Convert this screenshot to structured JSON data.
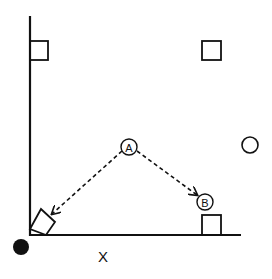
{
  "diagram": {
    "colors": {
      "ink": "#111111",
      "background": "#ffffff"
    },
    "axes": {
      "x_label": "X"
    },
    "nodes": {
      "a": {
        "label": "A",
        "shape": "circle-labeled"
      },
      "b": {
        "label": "B",
        "shape": "circle-labeled"
      }
    },
    "shapes": [
      {
        "id": "square-top-left",
        "shape": "square"
      },
      {
        "id": "square-top-right",
        "shape": "square"
      },
      {
        "id": "square-bottom-right",
        "shape": "square"
      },
      {
        "id": "square-rotated-origin",
        "shape": "rotated-square"
      },
      {
        "id": "circle-right",
        "shape": "circle-open"
      },
      {
        "id": "dot-origin",
        "shape": "circle-filled"
      }
    ],
    "arrows": [
      {
        "from": "A",
        "to": "rotated-square",
        "style": "dashed"
      },
      {
        "from": "A",
        "to": "B",
        "style": "dashed"
      }
    ]
  }
}
